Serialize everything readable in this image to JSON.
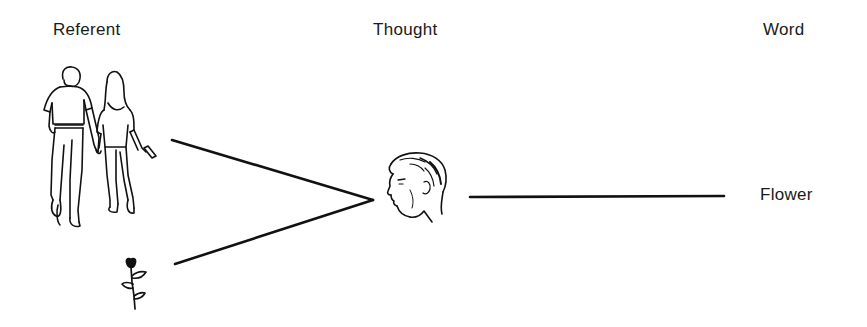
{
  "diagram": {
    "type": "semiotic-relation",
    "columns": [
      {
        "id": "referent",
        "heading": "Referent"
      },
      {
        "id": "thought",
        "heading": "Thought"
      },
      {
        "id": "word",
        "heading": "Word"
      }
    ],
    "nodes": {
      "referent_couple": {
        "icon": "walking-couple-icon",
        "column": "referent"
      },
      "referent_flower": {
        "icon": "flower-icon",
        "column": "referent"
      },
      "thought_head": {
        "icon": "man-head-profile-icon",
        "column": "thought"
      },
      "word": {
        "text": "Flower",
        "column": "word"
      }
    },
    "edges": [
      {
        "from": "referent_couple",
        "to": "thought_head"
      },
      {
        "from": "referent_flower",
        "to": "thought_head"
      },
      {
        "from": "thought_head",
        "to": "word"
      }
    ],
    "colors": {
      "ink": "#111111",
      "background": "#ffffff"
    }
  },
  "labels": {
    "referent": "Referent",
    "thought": "Thought",
    "word": "Word",
    "flower": "Flower"
  }
}
